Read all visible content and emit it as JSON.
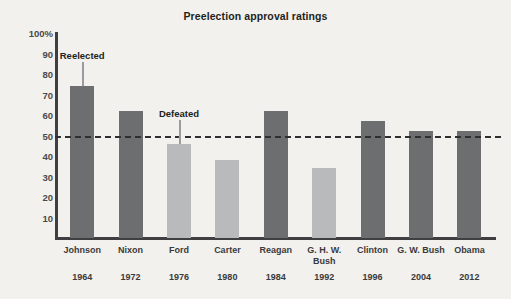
{
  "chart_data": {
    "type": "bar",
    "title": "Preelection approval ratings",
    "xlabel": "",
    "ylabel": "",
    "ylim": [
      0,
      100
    ],
    "grid": false,
    "legend_position": "none",
    "categories": [
      "Johnson",
      "Nixon",
      "Ford",
      "Carter",
      "Reagan",
      "G. H. W. Bush",
      "Clinton",
      "G. W. Bush",
      "Obama"
    ],
    "years": [
      "1964",
      "1972",
      "1976",
      "1980",
      "1984",
      "1992",
      "1996",
      "2004",
      "2012"
    ],
    "values": [
      74,
      62,
      46,
      38,
      62,
      34,
      57,
      52,
      52
    ],
    "outcome": [
      "reelected",
      "reelected",
      "defeated",
      "defeated",
      "reelected",
      "defeated",
      "reelected",
      "reelected",
      "reelected"
    ],
    "ytick_labels": [
      "100%",
      "90",
      "80",
      "70",
      "60",
      "50",
      "40",
      "30",
      "20",
      "10"
    ],
    "ytick_values": [
      100,
      90,
      80,
      70,
      60,
      50,
      40,
      30,
      20,
      10
    ],
    "threshold": {
      "value": 50,
      "style": "dashed"
    },
    "annotations": [
      {
        "text": "Reelected",
        "category": "Johnson",
        "value": 74
      },
      {
        "text": "Defeated",
        "category": "Ford",
        "value": 46
      }
    ],
    "colors": {
      "reelected_bar": "#6d6e70",
      "defeated_bar": "#b9babb",
      "axis": "#3f3f41",
      "background": "#f2f1ed",
      "text": "#231f20"
    }
  }
}
